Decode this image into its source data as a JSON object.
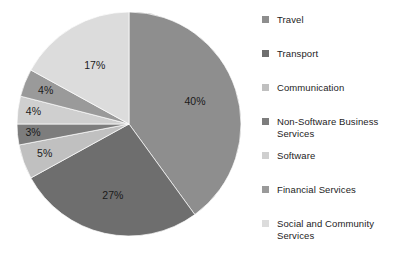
{
  "chart_data": {
    "type": "pie",
    "title": "",
    "legend_position": "right",
    "start_angle_deg": 0,
    "direction": "clockwise",
    "categories": [
      "Travel",
      "Transport",
      "Communication",
      "Non-Software Business Services",
      "Software",
      "Financial Services",
      "Social and Community Services"
    ],
    "values": [
      40,
      27,
      5,
      3,
      4,
      4,
      17
    ],
    "value_unit": "%",
    "data_labels": [
      "40%",
      "27%",
      "5%",
      "3%",
      "4%",
      "4%",
      "17%"
    ],
    "colors": [
      "#8e8e8e",
      "#6e6e6e",
      "#c0c0c0",
      "#7d7d7d",
      "#cfcfcf",
      "#9a9a9a",
      "#dcdcdc"
    ],
    "slices": [
      {
        "label": "Travel",
        "value": 40,
        "display": "40%",
        "color": "#8e8e8e"
      },
      {
        "label": "Transport",
        "value": 27,
        "display": "27%",
        "color": "#6e6e6e"
      },
      {
        "label": "Communication",
        "value": 5,
        "display": "5%",
        "color": "#c0c0c0"
      },
      {
        "label": "Non-Software Business Services",
        "value": 3,
        "display": "3%",
        "color": "#7d7d7d"
      },
      {
        "label": "Software",
        "value": 4,
        "display": "4%",
        "color": "#cfcfcf"
      },
      {
        "label": "Financial Services",
        "value": 4,
        "display": "4%",
        "color": "#9a9a9a"
      },
      {
        "label": "Social and Community Services",
        "value": 17,
        "display": "17%",
        "color": "#dcdcdc"
      }
    ]
  },
  "legend": {
    "items": [
      {
        "label": "Travel",
        "color": "#8e8e8e"
      },
      {
        "label": "Transport",
        "color": "#6e6e6e"
      },
      {
        "label": "Communication",
        "color": "#c0c0c0"
      },
      {
        "label": "Non-Software Business\nServices",
        "color": "#7d7d7d"
      },
      {
        "label": "Software",
        "color": "#cfcfcf"
      },
      {
        "label": "Financial Services",
        "color": "#9a9a9a"
      },
      {
        "label": "Social and Community\nServices",
        "color": "#dcdcdc"
      }
    ]
  },
  "labels": {
    "travel": "40%",
    "transport": "27%",
    "communication": "5%",
    "non_software": "3%",
    "software": "4%",
    "financial": "4%",
    "social": "17%"
  }
}
